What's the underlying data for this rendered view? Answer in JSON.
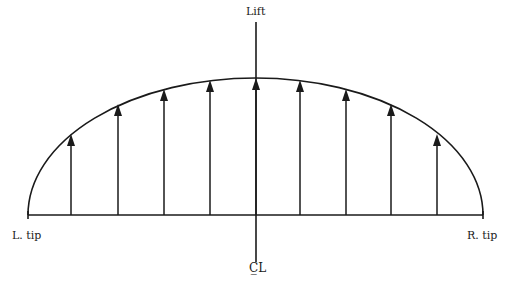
{
  "diagram": {
    "labels": {
      "lift": "Lift",
      "left_tip": "L. tip",
      "right_tip": "R. tip",
      "centerline": "C̲L"
    },
    "geometry": {
      "baseline_y": 215,
      "left_x": 28,
      "right_x": 483,
      "center_x": 256,
      "peak_y": 78,
      "axis_top_y": 22,
      "axis_bottom_y": 262
    },
    "arrows": [
      {
        "x": 71,
        "tip_y": 134
      },
      {
        "x": 118,
        "tip_y": 104
      },
      {
        "x": 164,
        "tip_y": 89
      },
      {
        "x": 210,
        "tip_y": 80
      },
      {
        "x": 256,
        "tip_y": 78
      },
      {
        "x": 300,
        "tip_y": 80
      },
      {
        "x": 346,
        "tip_y": 89
      },
      {
        "x": 391,
        "tip_y": 104
      },
      {
        "x": 437,
        "tip_y": 134
      }
    ],
    "stroke_color": "#1a1a1a"
  }
}
